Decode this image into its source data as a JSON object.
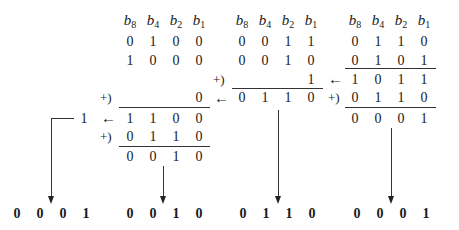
{
  "header_labels": [
    "8",
    "4",
    "2",
    "1"
  ],
  "groups": {
    "a": {
      "rows": [
        [
          "0",
          "1",
          "0",
          "0"
        ],
        [
          "1",
          "0",
          "0",
          "0"
        ]
      ],
      "partial": "0",
      "sum": [
        "1",
        "1",
        "0",
        "0"
      ],
      "carry": "1",
      "correction": [
        "0",
        "1",
        "1",
        "0"
      ],
      "result": [
        "0",
        "0",
        "1",
        "0"
      ]
    },
    "b": {
      "rows": [
        [
          "0",
          "0",
          "1",
          "1"
        ],
        [
          "0",
          "0",
          "1",
          "0"
        ]
      ],
      "partial": "1",
      "sum": [
        "0",
        "1",
        "1",
        "0"
      ]
    },
    "c": {
      "rows": [
        [
          "0",
          "1",
          "1",
          "0"
        ],
        [
          "0",
          "1",
          "0",
          "1"
        ]
      ],
      "sum": [
        "1",
        "0",
        "1",
        "1"
      ],
      "correction": [
        "0",
        "1",
        "1",
        "0"
      ],
      "result": [
        "0",
        "0",
        "0",
        "1"
      ]
    }
  },
  "symbols": {
    "plus": "+)",
    "left_arrow": "←"
  },
  "final": [
    [
      "0",
      "0",
      "0",
      "1"
    ],
    [
      "0",
      "0",
      "1",
      "0"
    ],
    [
      "0",
      "1",
      "1",
      "0"
    ],
    [
      "0",
      "0",
      "0",
      "1"
    ]
  ]
}
